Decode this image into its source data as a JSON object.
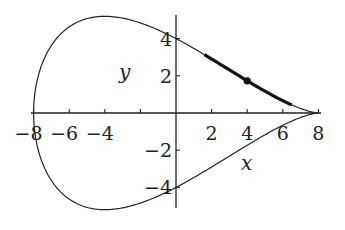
{
  "chart_data": {
    "type": "line",
    "title": "",
    "xlabel": "x",
    "ylabel": "y",
    "xlim": [
      -8,
      8
    ],
    "ylim": [
      -5.2,
      5.2
    ],
    "grid": false,
    "legend": null,
    "x_ticks": [
      -8,
      -6,
      -4,
      -2,
      2,
      4,
      6,
      8
    ],
    "x_tick_labels": [
      "−8",
      "−6",
      "−4",
      "",
      "2",
      "4",
      "6",
      "8"
    ],
    "y_ticks": [
      4,
      2,
      -2,
      -4
    ],
    "y_tick_labels": [
      "4",
      "2",
      "−2",
      "−4"
    ],
    "series": [
      {
        "name": "closed curve",
        "style": "thin",
        "description": "parametric curve x = 8cos t, y = 8 sin t sin²(t/2), 0 ≤ t ≤ 2π",
        "points": [
          [
            8,
            0
          ],
          [
            7.88,
            0.03
          ],
          [
            7.52,
            0.16
          ],
          [
            6.93,
            0.5
          ],
          [
            6.13,
            1.1
          ],
          [
            5.14,
            1.96
          ],
          [
            4,
            3.46
          ],
          [
            2.74,
            3.8
          ],
          [
            1.39,
            4.0
          ],
          [
            0,
            4
          ],
          [
            -1.39,
            4.7
          ],
          [
            -2.74,
            5.0
          ],
          [
            -4,
            5.2
          ],
          [
            -5.14,
            5.1
          ],
          [
            -6.13,
            4.6
          ],
          [
            -6.93,
            3.73
          ],
          [
            -7.52,
            2.6
          ],
          [
            -7.88,
            1.34
          ],
          [
            -8,
            0
          ],
          [
            -7.88,
            -1.34
          ],
          [
            -7.52,
            -2.6
          ],
          [
            -6.93,
            -3.73
          ],
          [
            -6.13,
            -4.6
          ],
          [
            -5.14,
            -5.1
          ],
          [
            -4,
            -5.2
          ],
          [
            -2.74,
            -5.0
          ],
          [
            -1.39,
            -4.7
          ],
          [
            0,
            -4
          ],
          [
            1.39,
            -3.4
          ],
          [
            2.74,
            -2.6
          ],
          [
            4,
            -1.73
          ],
          [
            5.14,
            -1.0
          ],
          [
            6.13,
            -0.5
          ],
          [
            6.93,
            -0.2
          ],
          [
            7.52,
            -0.05
          ],
          [
            8,
            0
          ]
        ]
      },
      {
        "name": "highlighted segment",
        "style": "bold",
        "points": [
          [
            1.6,
            3.1
          ],
          [
            4,
            1.73
          ],
          [
            6.5,
            0.35
          ]
        ]
      }
    ],
    "annotations": [
      {
        "type": "point",
        "x": 4,
        "y": 1.73
      }
    ]
  }
}
